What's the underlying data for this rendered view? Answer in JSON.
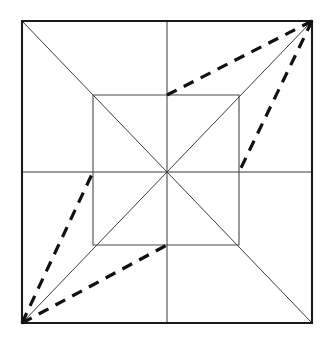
{
  "figure": {
    "canvas": {
      "width": 330,
      "height": 348,
      "background": "#ffffff"
    },
    "colors": {
      "outer_square_stroke": "#1a1a1a",
      "inner_square_stroke": "#4a4a4a",
      "thin_line_stroke": "#3b3b3b",
      "dashed_line_stroke": "#111111"
    },
    "points": {
      "outer_top_left": {
        "x": 22,
        "y": 21
      },
      "outer_top_right": {
        "x": 312,
        "y": 21
      },
      "outer_bottom_right": {
        "x": 312,
        "y": 323
      },
      "outer_bottom_left": {
        "x": 22,
        "y": 323
      },
      "inner_top_left": {
        "x": 93,
        "y": 95
      },
      "inner_top_right": {
        "x": 239,
        "y": 95
      },
      "inner_bottom_right": {
        "x": 239,
        "y": 245
      },
      "inner_bottom_left": {
        "x": 93,
        "y": 245
      },
      "center": {
        "x": 167,
        "y": 172
      },
      "inner_top_mid": {
        "x": 167,
        "y": 95
      },
      "inner_right_mid": {
        "x": 239,
        "y": 172
      },
      "inner_bottom_mid": {
        "x": 167,
        "y": 245
      },
      "inner_left_mid": {
        "x": 93,
        "y": 172
      },
      "outer_top_mid": {
        "x": 167,
        "y": 21
      },
      "outer_bottom_mid": {
        "x": 167,
        "y": 323
      },
      "outer_left_mid": {
        "x": 22,
        "y": 172
      },
      "outer_right_mid": {
        "x": 312,
        "y": 172
      }
    },
    "shapes": {
      "outer_square": "22,21 312,21 312,323 22,323",
      "inner_square": "93,95 239,95 239,245 93,245"
    },
    "solid_lines": [
      {
        "name": "diagonal-tl-br",
        "x1": 22,
        "y1": 21,
        "x2": 312,
        "y2": 323
      },
      {
        "name": "diagonal-tr-bl",
        "x1": 312,
        "y1": 21,
        "x2": 22,
        "y2": 323
      },
      {
        "name": "median-horizontal",
        "x1": 22,
        "y1": 172,
        "x2": 312,
        "y2": 172
      },
      {
        "name": "median-vertical",
        "x1": 167,
        "y1": 21,
        "x2": 167,
        "y2": 323
      }
    ],
    "dashed_lines": [
      {
        "name": "dash-topright-to-inner-top-mid",
        "x1": 312,
        "y1": 21,
        "x2": 167,
        "y2": 95
      },
      {
        "name": "dash-topright-to-inner-right-mid",
        "x1": 312,
        "y1": 21,
        "x2": 239,
        "y2": 172
      },
      {
        "name": "dash-bottomleft-to-inner-bottom-mid",
        "x1": 22,
        "y1": 323,
        "x2": 167,
        "y2": 245
      },
      {
        "name": "dash-bottomleft-to-inner-left-mid",
        "x1": 22,
        "y1": 323,
        "x2": 93,
        "y2": 172
      }
    ]
  }
}
